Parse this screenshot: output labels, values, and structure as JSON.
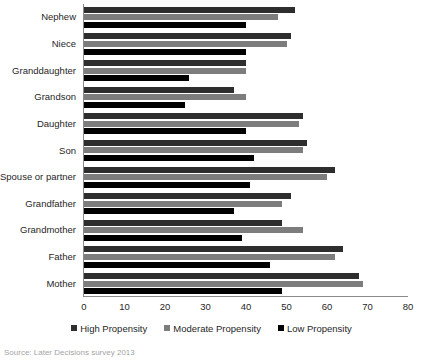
{
  "chart_data": {
    "type": "bar",
    "orientation": "horizontal",
    "title": "",
    "subtitle": "",
    "xlabel": "",
    "ylabel": "",
    "xlim": [
      0,
      80
    ],
    "xticks": [
      0,
      10,
      20,
      30,
      40,
      50,
      60,
      70,
      80
    ],
    "xtick_labels": [
      "0",
      "10",
      "20",
      "30",
      "40",
      "50",
      "60",
      "70",
      "80"
    ],
    "grid": false,
    "legend_position": "bottom",
    "categories": [
      "Nephew",
      "Niece",
      "Granddaughter",
      "Grandson",
      "Daughter",
      "Son",
      "Spouse or partner",
      "Grandfather",
      "Grandmother",
      "Father",
      "Mother"
    ],
    "series": [
      {
        "name": "High Propensity",
        "color": "#2e2e2e",
        "values": [
          52,
          51,
          40,
          37,
          54,
          55,
          62,
          51,
          49,
          64,
          68
        ]
      },
      {
        "name": "Moderate Propensity",
        "color": "#7d7d7d",
        "values": [
          48,
          50,
          40,
          40,
          53,
          54,
          60,
          49,
          54,
          62,
          69
        ]
      },
      {
        "name": "Low Propensity",
        "color": "#000000",
        "values": [
          40,
          40,
          26,
          25,
          40,
          42,
          41,
          37,
          39,
          46,
          49
        ]
      }
    ],
    "annotations": []
  },
  "legend": {
    "items": [
      {
        "label": "High Propensity",
        "key": "high"
      },
      {
        "label": "Moderate Propensity",
        "key": "moderate"
      },
      {
        "label": "Low Propensity",
        "key": "low"
      }
    ]
  },
  "source_note": "Source: Later Decisions survey 2013"
}
